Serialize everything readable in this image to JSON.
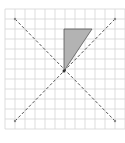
{
  "diagram": {
    "type": "geometry-grid",
    "grid": {
      "cell_size_px": 10,
      "columns": 12,
      "rows": 12,
      "line_color": "#d4d4d4",
      "background": "#ffffff"
    },
    "center_point": {
      "x": 64,
      "y": 71
    },
    "dashed_lines": [
      {
        "name": "diagonal-descending",
        "from": [
          15,
          19
        ],
        "to": [
          115,
          121
        ]
      },
      {
        "name": "diagonal-ascending",
        "from": [
          115,
          19
        ],
        "to": [
          15,
          121
        ]
      }
    ],
    "shaded_triangle": {
      "vertices": [
        [
          64,
          29
        ],
        [
          92,
          29
        ],
        [
          64,
          71
        ]
      ],
      "fill": "#b3b3b3",
      "stroke": "#555555"
    },
    "colors": {
      "dashed_line": "#555555",
      "endpoint_marker": "#888888"
    }
  }
}
